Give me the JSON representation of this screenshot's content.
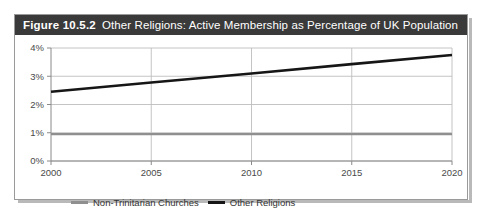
{
  "figure": {
    "number_label": "Figure 10.5.2",
    "caption": "Other Religions: Active Membership as Percentage of UK Population"
  },
  "colors": {
    "title_bar_background": "#3a3a3a",
    "title_bar_text": "#ffffff",
    "frame_border": "#9a9a9a",
    "frame_shadow": "#b9b9b9",
    "gridline": "#bdbdbd",
    "axis": "#8a8a8a",
    "other_religions_line": "#161616",
    "non_trinitarian_line": "#8f8f8f",
    "tick_text": "#4a4a4a"
  },
  "legend": {
    "position": "bottom-left",
    "entries": [
      {
        "label": "Non-Trinitarian Churches",
        "color": "#8f8f8f",
        "style": "gray"
      },
      {
        "label": "Other Religions",
        "color": "#161616",
        "style": "black"
      }
    ]
  },
  "chart_data": {
    "type": "line",
    "title": "Other Religions: Active Membership as Percentage of UK Population",
    "xlabel": "",
    "ylabel": "",
    "x": [
      2000,
      2005,
      2010,
      2015,
      2020
    ],
    "xlim": [
      2000,
      2020
    ],
    "ylim": [
      0,
      4
    ],
    "xticks": [
      2000,
      2005,
      2010,
      2015,
      2020
    ],
    "xtick_labels": [
      "2000",
      "2005",
      "2010",
      "2015",
      "2020"
    ],
    "yticks": [
      0,
      1,
      2,
      3,
      4
    ],
    "ytick_labels": [
      "0%",
      "1%",
      "2%",
      "3%",
      "4%"
    ],
    "grid": true,
    "legend_position": "bottom-left",
    "series": [
      {
        "name": "Non-Trinitarian Churches",
        "color": "#8f8f8f",
        "values": [
          0.95,
          0.95,
          0.95,
          0.95,
          0.95
        ]
      },
      {
        "name": "Other Religions",
        "color": "#161616",
        "values": [
          2.45,
          2.78,
          3.1,
          3.43,
          3.75
        ]
      }
    ]
  }
}
